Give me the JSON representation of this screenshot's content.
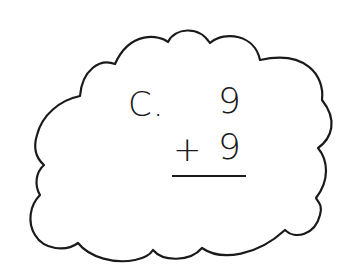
{
  "problem": {
    "label": "C.",
    "top_addend": "9",
    "operator": "+",
    "bottom_addend": "9"
  },
  "colors": {
    "stroke": "#1a1a1a",
    "background": "#ffffff"
  }
}
